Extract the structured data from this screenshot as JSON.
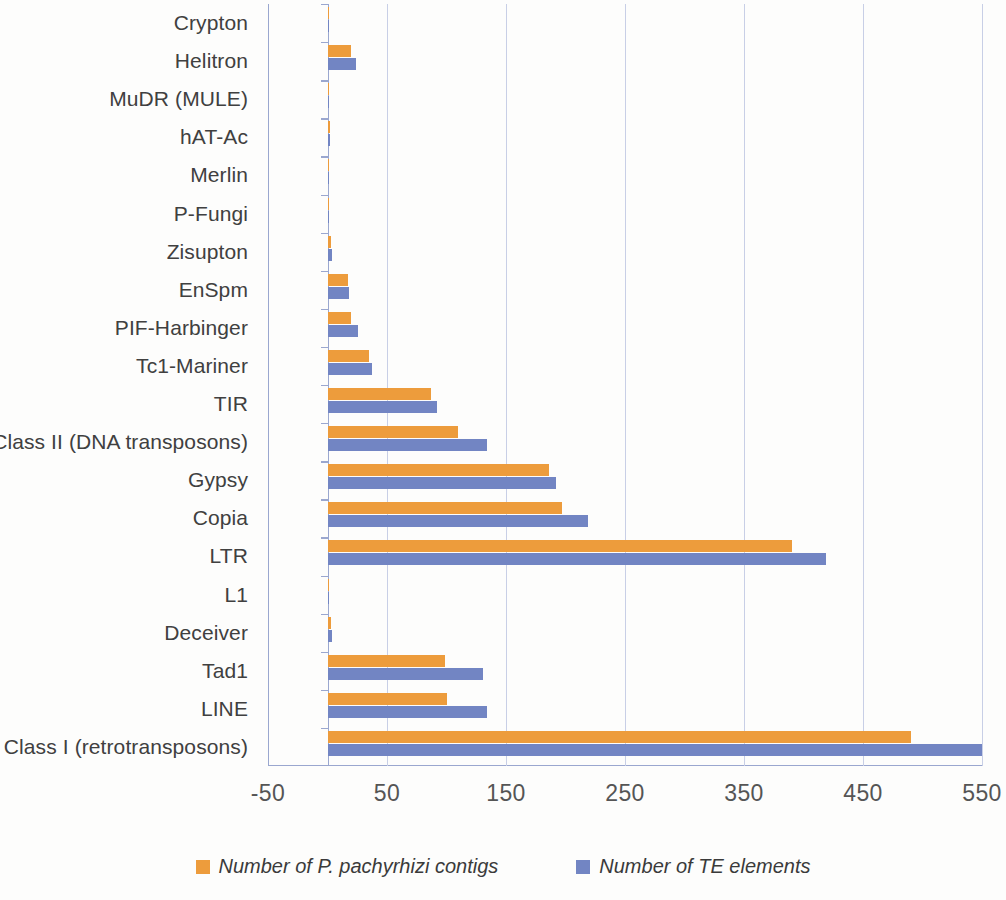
{
  "chart_data": {
    "type": "bar",
    "orientation": "horizontal",
    "title": "",
    "xlabel": "",
    "ylabel": "",
    "xlim": [
      -50,
      550
    ],
    "xticks": [
      -50,
      50,
      150,
      250,
      350,
      450,
      550
    ],
    "grid": true,
    "legend_position": "bottom",
    "categories": [
      "Crypton",
      "Helitron",
      "MuDR (MULE)",
      "hAT-Ac",
      "Merlin",
      "P-Fungi",
      "Zisupton",
      "EnSpm",
      "PIF-Harbinger",
      "Tc1-Mariner",
      "TIR",
      "Class II (DNA transposons)",
      "Gypsy",
      "Copia",
      "LTR",
      "L1",
      "Deceiver",
      "Tad1",
      "LINE",
      "Class I (retrotransposons)"
    ],
    "series": [
      {
        "name": "Number of P. pachyrhizi contigs",
        "color": "#ED9C3C",
        "values": [
          1,
          20,
          1,
          2,
          1,
          1,
          3,
          17,
          20,
          35,
          87,
          110,
          186,
          197,
          390,
          1,
          3,
          99,
          100,
          490
        ]
      },
      {
        "name": "Number of TE elements",
        "color": "#7285C3",
        "values": [
          1,
          24,
          1,
          2,
          1,
          1,
          4,
          18,
          26,
          37,
          92,
          134,
          192,
          219,
          419,
          1,
          4,
          131,
          134,
          550
        ]
      }
    ]
  },
  "legend": {
    "items": [
      {
        "label": "Number of P. pachyrhizi contigs",
        "color": "#ED9C3C",
        "swatch": "orange-swatch"
      },
      {
        "label": "Number of TE elements",
        "color": "#7285C3",
        "swatch": "blue-swatch"
      }
    ]
  }
}
